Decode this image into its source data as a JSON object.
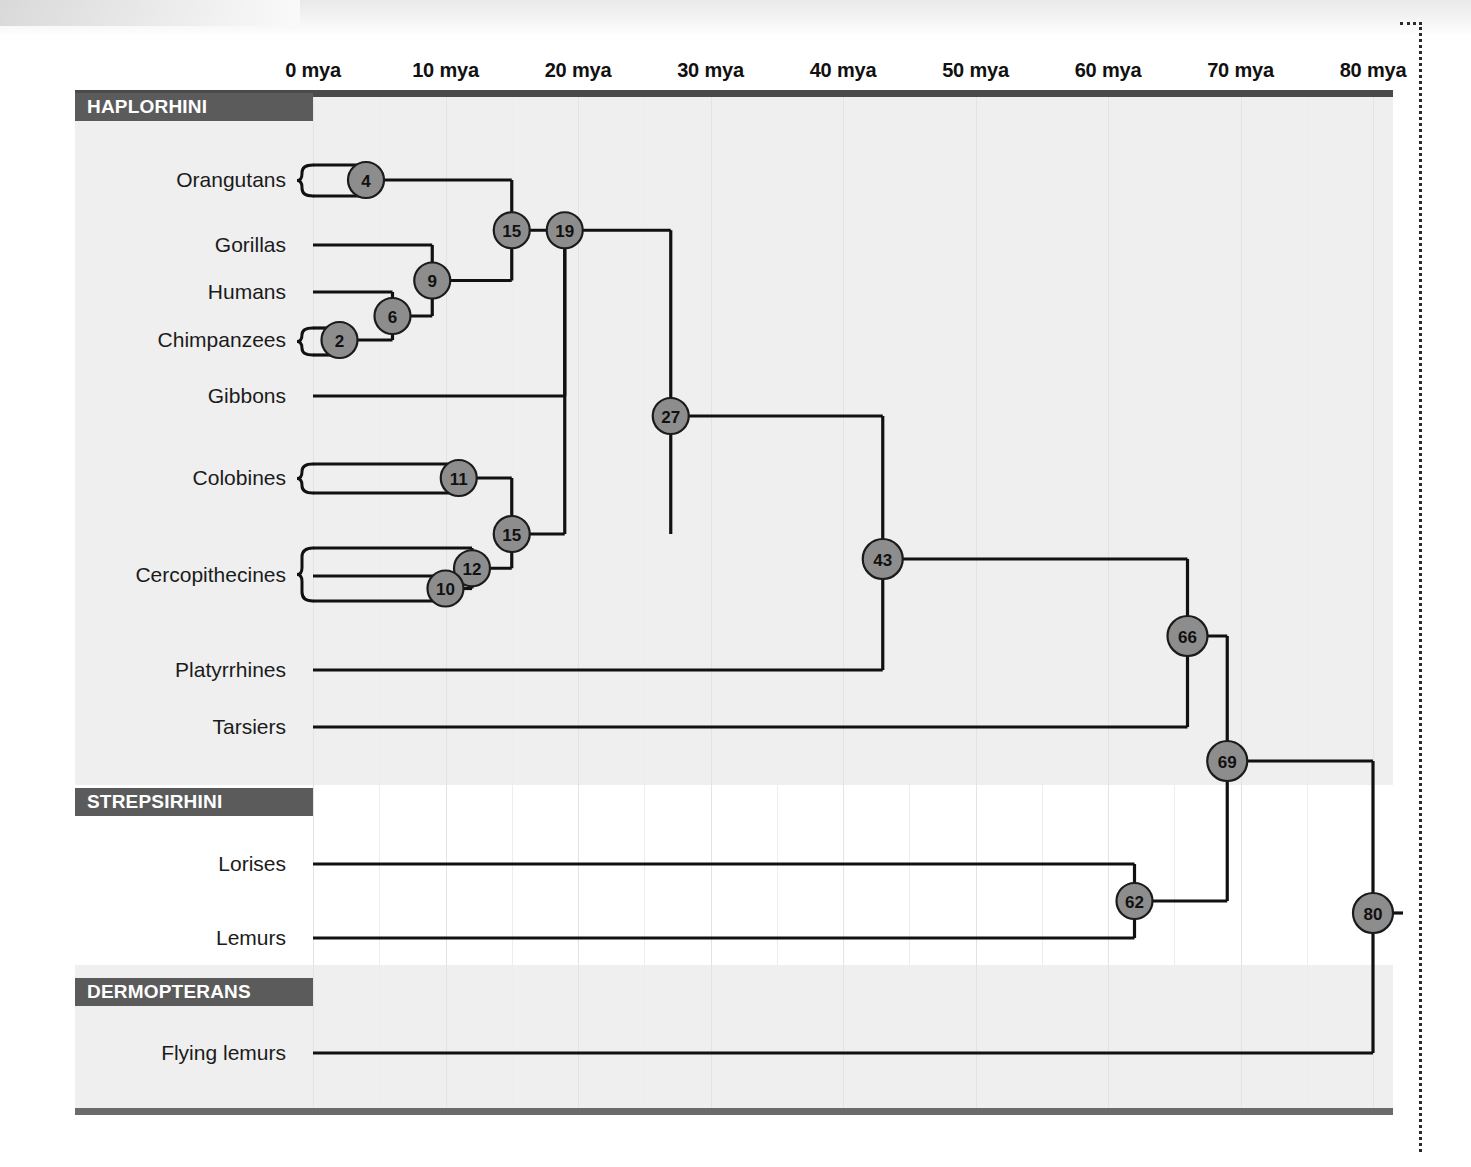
{
  "figure": {
    "axis_unit": "mya",
    "axis_ticks": [
      "0 mya",
      "10 mya",
      "20 mya",
      "30 mya",
      "40 mya",
      "50 mya",
      "60 mya",
      "70 mya",
      "80 mya"
    ],
    "axis_values": [
      0,
      10,
      20,
      30,
      40,
      50,
      60,
      70,
      80
    ]
  },
  "clades": [
    {
      "name": "HAPLORHINI"
    },
    {
      "name": "STREPSIRHINI"
    },
    {
      "name": "DERMOPTERANS"
    }
  ],
  "taxa": [
    {
      "label": "Orangutans",
      "group": "HAPLORHINI",
      "brace": 2
    },
    {
      "label": "Gorillas",
      "group": "HAPLORHINI",
      "brace": 0
    },
    {
      "label": "Humans",
      "group": "HAPLORHINI",
      "brace": 0
    },
    {
      "label": "Chimpanzees",
      "group": "HAPLORHINI",
      "brace": 2
    },
    {
      "label": "Gibbons",
      "group": "HAPLORHINI",
      "brace": 0
    },
    {
      "label": "Colobines",
      "group": "HAPLORHINI",
      "brace": 2
    },
    {
      "label": "Cercopithecines",
      "group": "HAPLORHINI",
      "brace": 3
    },
    {
      "label": "Platyrrhines",
      "group": "HAPLORHINI",
      "brace": 0
    },
    {
      "label": "Tarsiers",
      "group": "HAPLORHINI",
      "brace": 0
    },
    {
      "label": "Lorises",
      "group": "STREPSIRHINI",
      "brace": 0
    },
    {
      "label": "Lemurs",
      "group": "STREPSIRHINI",
      "brace": 0
    },
    {
      "label": "Flying lemurs",
      "group": "DERMOPTERANS",
      "brace": 0
    }
  ],
  "nodes": [
    {
      "id": "n4",
      "age": 4,
      "label": "4"
    },
    {
      "id": "n15a",
      "age": 15,
      "label": "15"
    },
    {
      "id": "n9",
      "age": 9,
      "label": "9"
    },
    {
      "id": "n6",
      "age": 6,
      "label": "6"
    },
    {
      "id": "n2",
      "age": 2,
      "label": "2"
    },
    {
      "id": "n19",
      "age": 19,
      "label": "19"
    },
    {
      "id": "n27",
      "age": 27,
      "label": "27"
    },
    {
      "id": "n11",
      "age": 11,
      "label": "11"
    },
    {
      "id": "n15b",
      "age": 15,
      "label": "15"
    },
    {
      "id": "n12",
      "age": 12,
      "label": "12"
    },
    {
      "id": "n10",
      "age": 10,
      "label": "10"
    },
    {
      "id": "n43",
      "age": 43,
      "label": "43"
    },
    {
      "id": "n66",
      "age": 66,
      "label": "66"
    },
    {
      "id": "n69",
      "age": 69,
      "label": "69"
    },
    {
      "id": "n62",
      "age": 62,
      "label": "62"
    },
    {
      "id": "n80",
      "age": 80,
      "label": "80"
    }
  ],
  "chart_data": {
    "type": "diagram",
    "subtype": "phylogenetic-tree",
    "xlabel": "Millions of years ago (mya)",
    "xlim": [
      0,
      84
    ],
    "x_ticks": [
      0,
      10,
      20,
      30,
      40,
      50,
      60,
      70,
      80
    ],
    "x_tick_labels": [
      "0 mya",
      "10 mya",
      "20 mya",
      "30 mya",
      "40 mya",
      "50 mya",
      "60 mya",
      "70 mya",
      "80 mya"
    ],
    "grid": "vertical",
    "legend": "none",
    "tips": [
      "Orangutans",
      "Gorillas",
      "Humans",
      "Chimpanzees",
      "Gibbons",
      "Colobines",
      "Cercopithecines",
      "Platyrrhines",
      "Tarsiers",
      "Lorises",
      "Lemurs",
      "Flying lemurs"
    ],
    "divergence_nodes": [
      {
        "age": 4,
        "children": [
          "Orangutan sp. A",
          "Orangutan sp. B"
        ]
      },
      {
        "age": 2,
        "children": [
          "Chimpanzee sp. A",
          "Chimpanzee sp. B"
        ]
      },
      {
        "age": 6,
        "children": [
          "Humans",
          "Chimpanzees"
        ]
      },
      {
        "age": 9,
        "children": [
          "Gorillas",
          "node6"
        ]
      },
      {
        "age": 15,
        "children": [
          "Orangutans",
          "node9"
        ]
      },
      {
        "age": 19,
        "children": [
          "node15",
          "Gibbons"
        ]
      },
      {
        "age": 11,
        "children": [
          "Colobine sp. A",
          "Colobine sp. B"
        ]
      },
      {
        "age": 10,
        "children": [
          "Cercopithecine sp. B",
          "Cercopithecine sp. C"
        ]
      },
      {
        "age": 12,
        "children": [
          "Cercopithecine sp. A",
          "node10"
        ]
      },
      {
        "age": 15,
        "children": [
          "node11",
          "node12"
        ]
      },
      {
        "age": 27,
        "children": [
          "node19",
          "node15b"
        ]
      },
      {
        "age": 43,
        "children": [
          "node27",
          "Platyrrhines"
        ]
      },
      {
        "age": 66,
        "children": [
          "node43",
          "Tarsiers"
        ]
      },
      {
        "age": 62,
        "children": [
          "Lorises",
          "Lemurs"
        ]
      },
      {
        "age": 69,
        "children": [
          "node66",
          "node62"
        ]
      },
      {
        "age": 80,
        "children": [
          "node69",
          "Flying lemurs"
        ]
      }
    ],
    "node_ages": [
      4,
      2,
      6,
      9,
      15,
      19,
      11,
      10,
      12,
      15,
      27,
      43,
      66,
      62,
      69,
      80
    ],
    "clade_bands": [
      "HAPLORHINI",
      "STREPSIRHINI",
      "DERMOPTERANS"
    ]
  },
  "colors": {
    "node_fill": "#8d8d8d",
    "node_stroke": "#1b1b1b",
    "banner_bg": "#5b5b5b",
    "banner_text": "#ffffff",
    "band_shade": "#efefef",
    "branch": "#111111",
    "grid": "#e3e3e3"
  }
}
